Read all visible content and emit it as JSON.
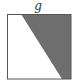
{
  "diagram": {
    "label_top": "g",
    "square": {
      "x": 7,
      "y": 14,
      "size": 64,
      "stroke": "#555555"
    },
    "shaded_region": {
      "points": [
        [
          21,
          14
        ],
        [
          71,
          14
        ],
        [
          71,
          79
        ],
        [
          62,
          79
        ]
      ],
      "fill": "#6e6e6e"
    }
  }
}
